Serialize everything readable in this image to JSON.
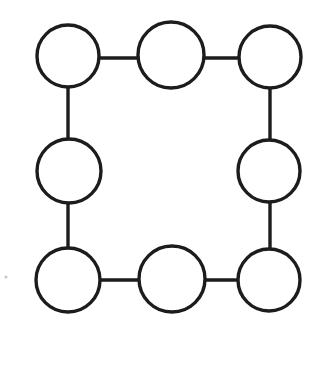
{
  "diagram": {
    "type": "cycle-graph",
    "canvas": {
      "width": 309,
      "height": 379,
      "background": "#ffffff"
    },
    "style": {
      "stroke_color": "#1c1c1c",
      "node_fill": "#ffffff",
      "stroke_width": 3.4,
      "speck_color": "#c8c8c8"
    },
    "node_count": 8,
    "edge_count": 8,
    "nodes": [
      {
        "id": "top-left",
        "label": "",
        "cx": 68,
        "cy": 56,
        "r": 31
      },
      {
        "id": "top-middle",
        "label": "",
        "cx": 171,
        "cy": 55,
        "r": 33
      },
      {
        "id": "top-right",
        "label": "",
        "cx": 270,
        "cy": 57,
        "r": 31
      },
      {
        "id": "middle-left",
        "label": "",
        "cx": 69,
        "cy": 171,
        "r": 32
      },
      {
        "id": "middle-right",
        "label": "",
        "cx": 269,
        "cy": 171,
        "r": 31
      },
      {
        "id": "bottom-left",
        "label": "",
        "cx": 68,
        "cy": 280,
        "r": 32
      },
      {
        "id": "bottom-middle",
        "label": "",
        "cx": 172,
        "cy": 279,
        "r": 33
      },
      {
        "id": "bottom-right",
        "label": "",
        "cx": 269,
        "cy": 280,
        "r": 31
      }
    ],
    "edges": [
      {
        "id": "edge-top-left-to-top-middle",
        "from": "top-left",
        "to": "top-middle",
        "x1": 99,
        "y1": 58,
        "x2": 138,
        "y2": 58,
        "orientation": "horizontal"
      },
      {
        "id": "edge-top-middle-to-top-right",
        "from": "top-middle",
        "to": "top-right",
        "x1": 204,
        "y1": 58,
        "x2": 239,
        "y2": 58,
        "orientation": "horizontal"
      },
      {
        "id": "edge-top-left-to-middle-left",
        "from": "top-left",
        "to": "middle-left",
        "x1": 68,
        "y1": 87,
        "x2": 68,
        "y2": 139,
        "orientation": "vertical"
      },
      {
        "id": "edge-top-right-to-middle-right",
        "from": "top-right",
        "to": "middle-right",
        "x1": 270,
        "y1": 88,
        "x2": 270,
        "y2": 140,
        "orientation": "vertical"
      },
      {
        "id": "edge-middle-left-to-bottom-left",
        "from": "middle-left",
        "to": "bottom-left",
        "x1": 68,
        "y1": 203,
        "x2": 68,
        "y2": 248,
        "orientation": "vertical"
      },
      {
        "id": "edge-middle-right-to-bottom-right",
        "from": "middle-right",
        "to": "bottom-right",
        "x1": 270,
        "y1": 202,
        "x2": 270,
        "y2": 249,
        "orientation": "vertical"
      },
      {
        "id": "edge-bottom-left-to-bottom-middle",
        "from": "bottom-left",
        "to": "bottom-middle",
        "x1": 100,
        "y1": 280,
        "x2": 139,
        "y2": 280,
        "orientation": "horizontal"
      },
      {
        "id": "edge-bottom-middle-to-bottom-right",
        "from": "bottom-middle",
        "to": "bottom-right",
        "x1": 205,
        "y1": 280,
        "x2": 238,
        "y2": 280,
        "orientation": "horizontal"
      }
    ],
    "artifacts": [
      {
        "id": "speck",
        "cx": 6,
        "cy": 277,
        "r": 1.6
      }
    ]
  }
}
